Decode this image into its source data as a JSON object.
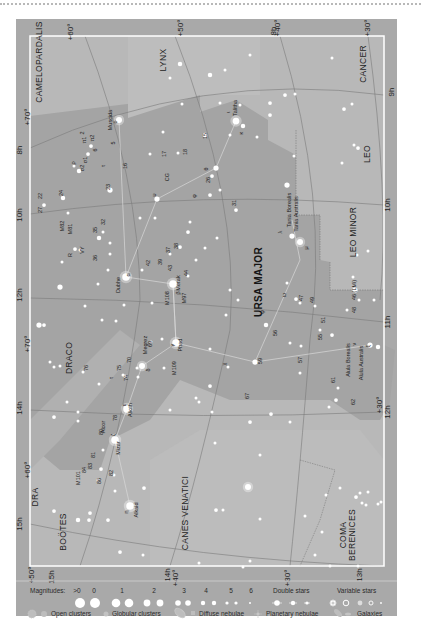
{
  "colors": {
    "outer_bg": "#a9a9a9",
    "map_bg": "#b7b7b7",
    "milky_dark": "#a6a6a6",
    "ursa_region": "#a2a2a2",
    "border": "#ffffff",
    "grid_line": "#7d7d7d",
    "star": "#ffffff",
    "legend_bg": "#a9a9a9"
  },
  "constellations": [
    {
      "name": "CAMELOPARDALIS",
      "x": 42,
      "y": 62,
      "rotate": -90
    },
    {
      "name": "LYNX",
      "x": 166,
      "y": 60,
      "rotate": -90
    },
    {
      "name": "CANCER",
      "x": 366,
      "y": 64,
      "rotate": -90
    },
    {
      "name": "LEO",
      "x": 370,
      "y": 154,
      "rotate": -90
    },
    {
      "name": "LEO MINOR",
      "x": 356,
      "y": 232,
      "rotate": -90
    },
    {
      "name": "URSA MAJOR",
      "x": 262,
      "y": 282,
      "rotate": -90,
      "big": true
    },
    {
      "name": "DRACO",
      "x": 72,
      "y": 358,
      "rotate": -90
    },
    {
      "name": "DRA",
      "x": 38,
      "y": 497,
      "rotate": -90
    },
    {
      "name": "BOÖTES",
      "x": 66,
      "y": 532,
      "rotate": -90
    },
    {
      "name": "CANES VENATICI",
      "x": 188,
      "y": 513,
      "rotate": -90
    },
    {
      "name": "COMA",
      "x": 346,
      "y": 535,
      "rotate": -90
    },
    {
      "name": "BERENICES",
      "x": 355,
      "y": 535,
      "rotate": -90
    }
  ],
  "edge_labels": [
    {
      "text": "+60°",
      "x": 73,
      "y": 32
    },
    {
      "text": "+50°",
      "x": 183,
      "y": 28
    },
    {
      "text": "8h",
      "x": 276,
      "y": 31
    },
    {
      "text": "+40°",
      "x": 280,
      "y": 28
    },
    {
      "text": "+30°",
      "x": 370,
      "y": 28
    },
    {
      "text": "8h",
      "x": 22,
      "y": 150
    },
    {
      "text": "+70°",
      "x": 30,
      "y": 117
    },
    {
      "text": "10h",
      "x": 22,
      "y": 215
    },
    {
      "text": "12h",
      "x": 22,
      "y": 295
    },
    {
      "text": "+70°",
      "x": 30,
      "y": 344
    },
    {
      "text": "14h",
      "x": 22,
      "y": 408
    },
    {
      "text": "+60°",
      "x": 30,
      "y": 470
    },
    {
      "text": "15h",
      "x": 22,
      "y": 524
    },
    {
      "text": "+50°",
      "x": 34,
      "y": 575
    },
    {
      "text": "15h",
      "x": 54,
      "y": 577
    },
    {
      "text": "14h",
      "x": 170,
      "y": 575
    },
    {
      "text": "+40°",
      "x": 178,
      "y": 578
    },
    {
      "text": "+30°",
      "x": 290,
      "y": 578
    },
    {
      "text": "13h",
      "x": 362,
      "y": 575
    },
    {
      "text": "9h",
      "x": 394,
      "y": 92
    },
    {
      "text": "10h",
      "x": 390,
      "y": 205
    },
    {
      "text": "11h",
      "x": 390,
      "y": 322
    },
    {
      "text": "+30°",
      "x": 382,
      "y": 405
    },
    {
      "text": "12h",
      "x": 390,
      "y": 412
    }
  ],
  "star_labels": [
    {
      "text": "Muscida",
      "x": 112,
      "y": 120
    },
    {
      "text": "ο",
      "x": 117,
      "y": 122
    },
    {
      "text": "π1",
      "x": 86,
      "y": 140
    },
    {
      "text": "2",
      "x": 84,
      "y": 133
    },
    {
      "text": "π2",
      "x": 94,
      "y": 138
    },
    {
      "text": "6",
      "x": 97,
      "y": 150
    },
    {
      "text": "5",
      "x": 115,
      "y": 143
    },
    {
      "text": "σ1",
      "x": 87,
      "y": 160
    },
    {
      "text": "ρ",
      "x": 75,
      "y": 163
    },
    {
      "text": "σ2",
      "x": 84,
      "y": 168
    },
    {
      "text": "τ",
      "x": 105,
      "y": 166
    },
    {
      "text": "16",
      "x": 127,
      "y": 166
    },
    {
      "text": "23",
      "x": 110,
      "y": 187
    },
    {
      "text": "17",
      "x": 166,
      "y": 154
    },
    {
      "text": "18",
      "x": 187,
      "y": 152
    },
    {
      "text": "15",
      "x": 207,
      "y": 136
    },
    {
      "text": "Talitha",
      "x": 237,
      "y": 108
    },
    {
      "text": "ι",
      "x": 230,
      "y": 112
    },
    {
      "text": "κ",
      "x": 243,
      "y": 133
    },
    {
      "text": "CG",
      "x": 169,
      "y": 177
    },
    {
      "text": "θ",
      "x": 208,
      "y": 169
    },
    {
      "text": "26",
      "x": 210,
      "y": 180
    },
    {
      "text": "υ",
      "x": 156,
      "y": 195
    },
    {
      "text": "φ",
      "x": 196,
      "y": 196
    },
    {
      "text": "31",
      "x": 236,
      "y": 203
    },
    {
      "text": "22",
      "x": 42,
      "y": 196
    },
    {
      "text": "24",
      "x": 63,
      "y": 193
    },
    {
      "text": "27",
      "x": 42,
      "y": 210
    },
    {
      "text": "M82",
      "x": 64,
      "y": 226
    },
    {
      "text": "M81",
      "x": 72,
      "y": 229
    },
    {
      "text": "35",
      "x": 97,
      "y": 230
    },
    {
      "text": "32",
      "x": 105,
      "y": 222
    },
    {
      "text": "R",
      "x": 72,
      "y": 255
    },
    {
      "text": "VY",
      "x": 84,
      "y": 250
    },
    {
      "text": "36",
      "x": 97,
      "y": 258
    },
    {
      "text": "Tania Borealis",
      "x": 291,
      "y": 210
    },
    {
      "text": "Tania Australis",
      "x": 298,
      "y": 214
    },
    {
      "text": "λ",
      "x": 282,
      "y": 232
    },
    {
      "text": "μ",
      "x": 308,
      "y": 248
    },
    {
      "text": "42",
      "x": 150,
      "y": 263
    },
    {
      "text": "39",
      "x": 162,
      "y": 262
    },
    {
      "text": "37",
      "x": 170,
      "y": 250
    },
    {
      "text": "38",
      "x": 178,
      "y": 246
    },
    {
      "text": "43",
      "x": 172,
      "y": 268
    },
    {
      "text": "Merak",
      "x": 180,
      "y": 283
    },
    {
      "text": "β",
      "x": 180,
      "y": 293
    },
    {
      "text": "44",
      "x": 188,
      "y": 273
    },
    {
      "text": "Dubhe",
      "x": 120,
      "y": 285
    },
    {
      "text": "α",
      "x": 130,
      "y": 275
    },
    {
      "text": "M108",
      "x": 169,
      "y": 298
    },
    {
      "text": "M97",
      "x": 186,
      "y": 298
    },
    {
      "text": "ω",
      "x": 286,
      "y": 295
    },
    {
      "text": "ψ",
      "x": 264,
      "y": 312
    },
    {
      "text": "47",
      "x": 303,
      "y": 298
    },
    {
      "text": "49",
      "x": 314,
      "y": 300
    },
    {
      "text": "46 (LMi)",
      "x": 356,
      "y": 290
    },
    {
      "text": "48",
      "x": 356,
      "y": 310
    },
    {
      "text": "51",
      "x": 325,
      "y": 320
    },
    {
      "text": "56",
      "x": 277,
      "y": 333
    },
    {
      "text": "55",
      "x": 322,
      "y": 337
    },
    {
      "text": "59",
      "x": 262,
      "y": 361
    },
    {
      "text": "57",
      "x": 302,
      "y": 360
    },
    {
      "text": "χ",
      "x": 226,
      "y": 364
    },
    {
      "text": "ν",
      "x": 356,
      "y": 344
    },
    {
      "text": "ξ",
      "x": 370,
      "y": 346
    },
    {
      "text": "Alula Borealis",
      "x": 350,
      "y": 360
    },
    {
      "text": "Alula Australis",
      "x": 363,
      "y": 363
    },
    {
      "text": "61",
      "x": 335,
      "y": 380
    },
    {
      "text": "62",
      "x": 355,
      "y": 402
    },
    {
      "text": "67",
      "x": 249,
      "y": 396
    },
    {
      "text": "Phad",
      "x": 182,
      "y": 345
    },
    {
      "text": "γ",
      "x": 174,
      "y": 345
    },
    {
      "text": "M109",
      "x": 176,
      "y": 368
    },
    {
      "text": "Megrez",
      "x": 147,
      "y": 345
    },
    {
      "text": "δ",
      "x": 150,
      "y": 370
    },
    {
      "text": "69",
      "x": 152,
      "y": 344
    },
    {
      "text": "70",
      "x": 131,
      "y": 360
    },
    {
      "text": "75",
      "x": 121,
      "y": 368
    },
    {
      "text": "74",
      "x": 128,
      "y": 378
    },
    {
      "text": "76",
      "x": 88,
      "y": 368
    },
    {
      "text": "τ",
      "x": 113,
      "y": 378
    },
    {
      "text": "Alioth",
      "x": 132,
      "y": 410
    },
    {
      "text": "ε",
      "x": 126,
      "y": 405
    },
    {
      "text": "78",
      "x": 117,
      "y": 418
    },
    {
      "text": "Alcor",
      "x": 105,
      "y": 427
    },
    {
      "text": "80",
      "x": 103,
      "y": 432
    },
    {
      "text": "Mizar",
      "x": 120,
      "y": 448
    },
    {
      "text": "ζ",
      "x": 115,
      "y": 435
    },
    {
      "text": "81",
      "x": 95,
      "y": 455
    },
    {
      "text": "83",
      "x": 92,
      "y": 466
    },
    {
      "text": "84",
      "x": 86,
      "y": 470
    },
    {
      "text": "82",
      "x": 113,
      "y": 473
    },
    {
      "text": "86",
      "x": 101,
      "y": 481
    },
    {
      "text": "M101",
      "x": 80,
      "y": 478
    },
    {
      "text": "Alkaid",
      "x": 138,
      "y": 510
    },
    {
      "text": "η",
      "x": 128,
      "y": 512
    }
  ],
  "legend": {
    "magnitudes_label": "Magnitudes:",
    "magnitude_values": [
      ">0",
      "0",
      "1",
      "2",
      "3",
      "4",
      "5",
      "6"
    ],
    "double_stars_label": "Double stars",
    "variable_stars_label": "Variable stars",
    "open_clusters_label": "Open clusters",
    "globular_clusters_label": "Globular clusters",
    "diffuse_nebulae_label": "Diffuse nebulae",
    "planetary_nebulae_label": "Planetary nebulae",
    "galaxies_label": "Galaxies"
  }
}
